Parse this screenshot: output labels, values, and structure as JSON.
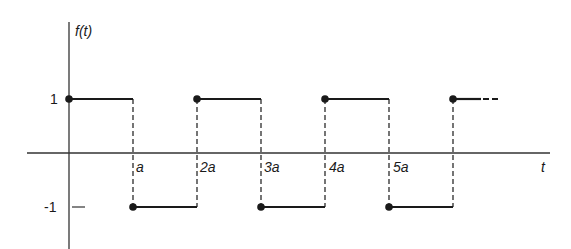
{
  "diagram": {
    "y_axis_label": "f(t)",
    "x_axis_label": "t",
    "y_ticks": [
      {
        "label": "1",
        "value": 1
      },
      {
        "label": "-1",
        "value": -1
      }
    ],
    "x_ticks": [
      {
        "label": "a",
        "value": 1
      },
      {
        "label": "2a",
        "value": 2
      },
      {
        "label": "3a",
        "value": 3
      },
      {
        "label": "4a",
        "value": 4
      },
      {
        "label": "5a",
        "value": 5
      }
    ],
    "segments": [
      {
        "from": 0,
        "to": 1,
        "level": 1
      },
      {
        "from": 1,
        "to": 2,
        "level": -1
      },
      {
        "from": 2,
        "to": 3,
        "level": 1
      },
      {
        "from": 3,
        "to": 4,
        "level": -1
      },
      {
        "from": 4,
        "to": 5,
        "level": 1
      },
      {
        "from": 5,
        "to": 6,
        "level": -1
      },
      {
        "from": 6,
        "to": 6.7,
        "level": 1,
        "continues": true
      }
    ],
    "colors": {
      "line": "#1a1a1a",
      "axis": "#333333",
      "background": "#ffffff"
    }
  }
}
